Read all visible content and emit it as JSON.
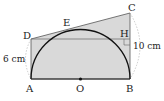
{
  "figure": {
    "points": {
      "A": {
        "label": "A",
        "x": 31,
        "y": 79
      },
      "B": {
        "label": "B",
        "x": 130,
        "y": 79
      },
      "O": {
        "label": "O",
        "x": 80.5,
        "y": 79
      },
      "C": {
        "label": "C",
        "x": 130,
        "y": 13
      },
      "D": {
        "label": "D",
        "x": 31,
        "y": 39
      },
      "E": {
        "label": "E",
        "x": 77,
        "y": 29
      },
      "H": {
        "label": "H",
        "x": 130,
        "y": 39
      }
    },
    "measures": {
      "AD": "6 cm",
      "BC": "10 cm"
    },
    "colors": {
      "fill": "#d9d9d9",
      "stroke": "#333333",
      "arc": "#111111",
      "dashed": "#aaaaaa"
    }
  }
}
